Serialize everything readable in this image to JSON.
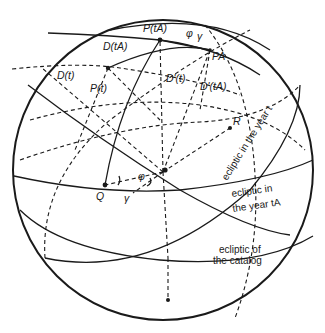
{
  "figure": {
    "type": "celestial-sphere-diagram",
    "points": {
      "P_tA": "P(tA)",
      "P_A": "PA",
      "D_tA": "D(tA)",
      "D_t": "D(t)",
      "P_t": "P(t)",
      "Dprime_t": "D'(t)",
      "Dprime_tA": "D'(tA)",
      "R": "R",
      "Q": "Q"
    },
    "angles": {
      "phi_top": "φ",
      "gamma_top": "γ",
      "phi_center": "φ",
      "gamma_bottom": "γ"
    },
    "planes": {
      "ecliptic_year_t": "ecliptic in the year t",
      "ecliptic_year_tA_line1": "ecliptic in",
      "ecliptic_year_tA_line2": "the year tA",
      "ecliptic_catalog_line1": "ecliptic of",
      "ecliptic_catalog_line2": "the catalog"
    }
  }
}
